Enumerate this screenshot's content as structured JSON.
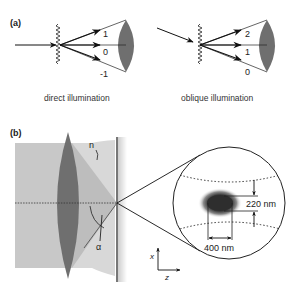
{
  "panel_a": {
    "label": "(a)",
    "left": {
      "caption": "direct illumination",
      "orders": [
        "1",
        "0",
        "-1"
      ]
    },
    "right": {
      "caption": "oblique illumination",
      "orders": [
        "2",
        "1",
        "0"
      ]
    }
  },
  "panel_b": {
    "label": "(b)",
    "refractive_index_label": "n",
    "angle_label": "α",
    "dimension_vertical": "220 nm",
    "dimension_horizontal": "400 nm",
    "axis_x": "x",
    "axis_z": "z"
  },
  "colors": {
    "lens": "#6f6f6f",
    "cone_dark": "#bdbdbd",
    "cone_light": "#d6d6d6",
    "background_block": "#c8c8c8",
    "line": "#222222",
    "focus_spot": "#3a3a3a"
  }
}
